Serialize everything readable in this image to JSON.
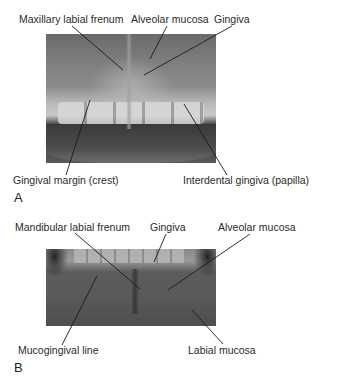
{
  "figure": {
    "panel_a": {
      "letter": "A",
      "photo_description": "Maxillary anterior teeth and gingiva",
      "labels": {
        "maxillary_labial_frenum": "Maxillary labial frenum",
        "alveolar_mucosa": "Alveolar mucosa",
        "gingiva": "Gingiva",
        "gingival_margin": "Gingival margin (crest)",
        "interdental_gingiva": "Interdental gingiva (papilla)"
      }
    },
    "panel_b": {
      "letter": "B",
      "photo_description": "Mandibular anterior gingiva and mucosa",
      "labels": {
        "mandibular_labial_frenum": "Mandibular labial frenum",
        "gingiva": "Gingiva",
        "alveolar_mucosa": "Alveolar mucosa",
        "mucogingival_line": "Mucogingival line",
        "labial_mucosa": "Labial mucosa"
      }
    }
  }
}
